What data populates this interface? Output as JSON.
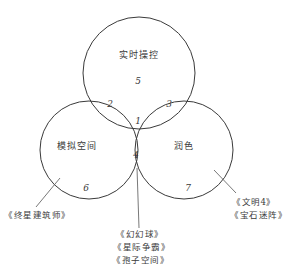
{
  "diagram": {
    "type": "venn",
    "sets": [
      {
        "id": "top",
        "label": "实时操控"
      },
      {
        "id": "left",
        "label": "模拟空间"
      },
      {
        "id": "right",
        "label": "润色"
      }
    ],
    "regions": {
      "all_three": "1",
      "top_left": "2",
      "top_right": "3",
      "left_right": "4",
      "top_only": "5",
      "left_only": "6",
      "right_only": "7"
    },
    "examples": {
      "left_only": [
        "《终星建筑师》"
      ],
      "right_only": [
        "《文明4》",
        "《宝石迷阵》"
      ],
      "left_right": [
        "《幻幻球》",
        "《星际争霸》",
        "《孢子空间》"
      ]
    },
    "colors": {
      "stroke": "#3a3a3a",
      "background": "#ffffff"
    }
  }
}
